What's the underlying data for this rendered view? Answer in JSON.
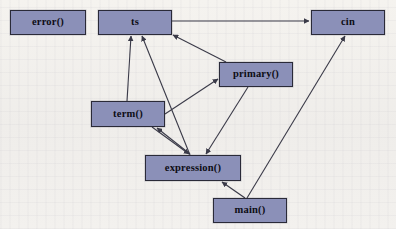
{
  "diagram": {
    "type": "call-graph",
    "background_color": "#f2f0eb",
    "node_fill_color": "#8b90b8",
    "node_border_color": "#2a2a38",
    "edge_color": "#3a3a48",
    "nodes": [
      {
        "id": "error",
        "label": "error()",
        "x": 10,
        "y": 10,
        "w": 76,
        "h": 25
      },
      {
        "id": "ts",
        "label": "ts",
        "x": 98,
        "y": 10,
        "w": 74,
        "h": 25
      },
      {
        "id": "cin",
        "label": "cin",
        "x": 311,
        "y": 10,
        "w": 74,
        "h": 25
      },
      {
        "id": "primary",
        "label": "primary()",
        "x": 219,
        "y": 62,
        "w": 74,
        "h": 25
      },
      {
        "id": "term",
        "label": "term()",
        "x": 91,
        "y": 101,
        "w": 74,
        "h": 26
      },
      {
        "id": "expression",
        "label": "expression()",
        "x": 145,
        "y": 155,
        "w": 96,
        "h": 26
      },
      {
        "id": "main",
        "label": "main()",
        "x": 213,
        "y": 198,
        "w": 74,
        "h": 25
      }
    ],
    "edges": [
      {
        "from": "ts",
        "to": "cin",
        "label": ""
      },
      {
        "from": "primary",
        "to": "ts",
        "label": ""
      },
      {
        "from": "term",
        "to": "ts",
        "label": ""
      },
      {
        "from": "expression",
        "to": "ts",
        "label": ""
      },
      {
        "from": "term",
        "to": "primary",
        "label": ""
      },
      {
        "from": "expression",
        "to": "term",
        "label": ""
      },
      {
        "from": "term",
        "to": "expression",
        "label": ""
      },
      {
        "from": "primary",
        "to": "expression",
        "label": ""
      },
      {
        "from": "main",
        "to": "expression",
        "label": ""
      },
      {
        "from": "main",
        "to": "cin",
        "label": ""
      }
    ]
  }
}
